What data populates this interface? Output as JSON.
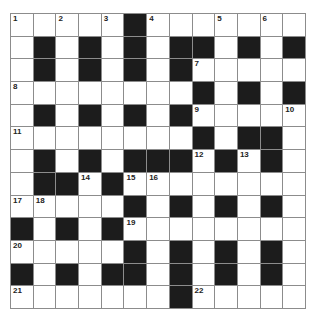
{
  "puzzle": {
    "rows": 13,
    "cols": 13,
    "layout": [
      "WWWWWBWWWWWWW",
      "WBWBWBWBBWBWB",
      "WBWBWBWBWWWWW",
      "WWWWWWWWBWBWB",
      "WBWBWBWBWWWWW",
      "WWWWWWWWBWBBW",
      "WBWBWBBBWBWBW",
      "WBBWBWWWWWWWW",
      "WWWWWBWBWBWBW",
      "BWBWBWWWWWWWW",
      "WWWWWBWBWBWBW",
      "BWBWBBWBWBWBW",
      "WWWWWWWBWWWWW"
    ],
    "numbers": [
      {
        "r": 0,
        "c": 0,
        "n": "1"
      },
      {
        "r": 0,
        "c": 2,
        "n": "2"
      },
      {
        "r": 0,
        "c": 4,
        "n": "3"
      },
      {
        "r": 0,
        "c": 6,
        "n": "4"
      },
      {
        "r": 0,
        "c": 9,
        "n": "5"
      },
      {
        "r": 0,
        "c": 11,
        "n": "6"
      },
      {
        "r": 2,
        "c": 8,
        "n": "7"
      },
      {
        "r": 3,
        "c": 0,
        "n": "8"
      },
      {
        "r": 4,
        "c": 8,
        "n": "9"
      },
      {
        "r": 4,
        "c": 12,
        "n": "10"
      },
      {
        "r": 5,
        "c": 0,
        "n": "11"
      },
      {
        "r": 6,
        "c": 8,
        "n": "12"
      },
      {
        "r": 6,
        "c": 10,
        "n": "13"
      },
      {
        "r": 7,
        "c": 3,
        "n": "14"
      },
      {
        "r": 7,
        "c": 5,
        "n": "15"
      },
      {
        "r": 7,
        "c": 6,
        "n": "16"
      },
      {
        "r": 8,
        "c": 0,
        "n": "17"
      },
      {
        "r": 8,
        "c": 1,
        "n": "18"
      },
      {
        "r": 9,
        "c": 5,
        "n": "19"
      },
      {
        "r": 10,
        "c": 0,
        "n": "20"
      },
      {
        "r": 12,
        "c": 0,
        "n": "21"
      },
      {
        "r": 12,
        "c": 8,
        "n": "22"
      }
    ],
    "colors": {
      "black_cell": "#1c1c1c",
      "white_cell": "#ffffff",
      "grid_line": "#8c8c8c"
    }
  }
}
